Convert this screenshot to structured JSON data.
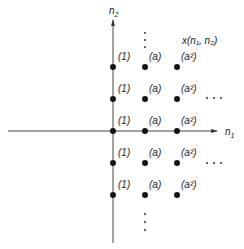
{
  "diagram": {
    "axes": {
      "x_label": "n",
      "x_label_sub": "1",
      "y_label": "n",
      "y_label_sub": "2"
    },
    "function_label": "x(n₁, n₂)",
    "column_labels": [
      "(1)",
      "(a)",
      "(a²)"
    ],
    "rows": [
      {
        "labels": [
          "(1)",
          "(a)",
          "(a²)"
        ],
        "ellipsis": false
      },
      {
        "labels": [
          "(1)",
          "(a)",
          "(a²)"
        ],
        "ellipsis": true
      },
      {
        "labels": [
          "(1)",
          "(a)",
          "(a²)"
        ],
        "ellipsis": false
      },
      {
        "labels": [
          "(1)",
          "(a)",
          "(a²)"
        ],
        "ellipsis": true
      },
      {
        "labels": [
          "(1)",
          "(a)",
          "(a²)"
        ],
        "ellipsis": false
      }
    ],
    "horizontal_ellipsis": "···",
    "vertical_ellipsis": "⋮"
  }
}
